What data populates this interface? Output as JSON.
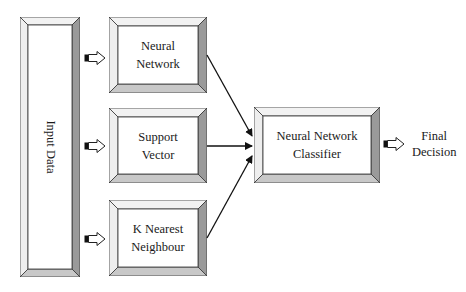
{
  "diagram": {
    "input": {
      "label": "Input Data"
    },
    "models": [
      {
        "label": "Neural\nNetwork"
      },
      {
        "label": "Support\nVector"
      },
      {
        "label": "K Nearest\nNeighbour"
      }
    ],
    "classifier": {
      "label": "Neural Network\nClassifier"
    },
    "output": {
      "label": "Final\nDecision"
    },
    "colors": {
      "border": "#333333",
      "bevel_light": "#ffffff",
      "bevel_mid": "#e6e6e6",
      "bevel_dark": "#9a9a9a",
      "bevel_bottom": "#c8c8c8",
      "arrow": "#111111"
    }
  }
}
